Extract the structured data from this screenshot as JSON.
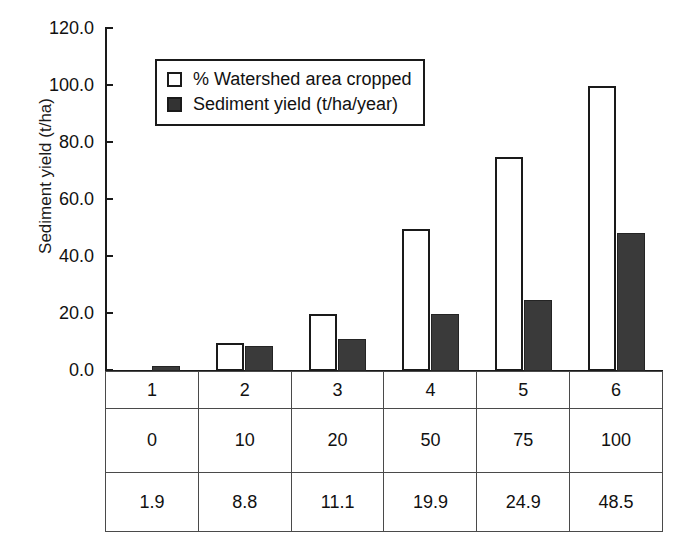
{
  "chart_data": {
    "type": "bar",
    "title": "",
    "xlabel": "",
    "ylabel": "Sediment yield (t/ha)",
    "ylim": [
      0,
      120
    ],
    "ytick_labels": [
      "120.0",
      "100.0",
      "80.0",
      "60.0",
      "40.0",
      "20.0",
      "0.0"
    ],
    "ytick_values": [
      120,
      100,
      80,
      60,
      40,
      20,
      0
    ],
    "grid": false,
    "legend_position": "upper-left-inside",
    "categories": [
      "1",
      "2",
      "3",
      "4",
      "5",
      "6"
    ],
    "series": [
      {
        "name": "% Watershed area cropped",
        "values": [
          0,
          10,
          20,
          50,
          75,
          100
        ],
        "style": "open",
        "color": "#ffffff",
        "edge_color": "#1a1a1a"
      },
      {
        "name": "Sediment yield (t/ha/year)",
        "values": [
          1.9,
          8.8,
          11.1,
          19.9,
          24.9,
          48.5
        ],
        "style": "filled",
        "color": "#3a3a3a",
        "edge_color": "#242424"
      }
    ]
  },
  "legend": {
    "items": [
      {
        "label": "% Watershed area cropped",
        "swatch": "open-square"
      },
      {
        "label": "Sediment yield (t/ha/year)",
        "swatch": "filled-square"
      }
    ]
  },
  "table": {
    "rows": [
      {
        "name": "category-row",
        "cells": [
          "1",
          "2",
          "3",
          "4",
          "5",
          "6"
        ]
      },
      {
        "name": "percent-cropped-row",
        "cells": [
          "0",
          "10",
          "20",
          "50",
          "75",
          "100"
        ]
      },
      {
        "name": "sediment-yield-row",
        "cells": [
          "1.9",
          "8.8",
          "11.1",
          "19.9",
          "24.9",
          "48.5"
        ]
      }
    ]
  }
}
